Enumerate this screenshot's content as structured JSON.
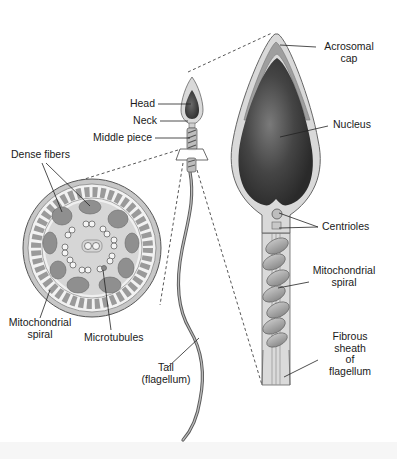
{
  "diagram": {
    "colors": {
      "membrane": "#d8d8d8",
      "nucleus_dark": "#2e2e2e",
      "nucleus_light": "#8a8a8a",
      "fill_light": "#e4e4e4",
      "outline": "#555555",
      "mito": "#a5a5a5",
      "background": "#ffffff"
    },
    "whole_cell_labels": {
      "head": "Head",
      "neck": "Neck",
      "middle_piece": "Middle piece",
      "tail_line1": "Tail",
      "tail_line2": "(flagellum)"
    },
    "cross_section_labels": {
      "dense_fibers": "Dense fibers",
      "mito_line1": "Mitochondrial",
      "mito_line2": "spiral",
      "microtubules": "Microtubules"
    },
    "enlarged_labels": {
      "acrosomal_line1": "Acrosomal",
      "acrosomal_line2": "cap",
      "nucleus": "Nucleus",
      "centrioles": "Centrioles",
      "mito_line1": "Mitochondrial",
      "mito_line2": "spiral",
      "fibrous_line1": "Fibrous",
      "fibrous_line2": "sheath",
      "fibrous_line3": "of",
      "fibrous_line4": "flagellum"
    }
  }
}
